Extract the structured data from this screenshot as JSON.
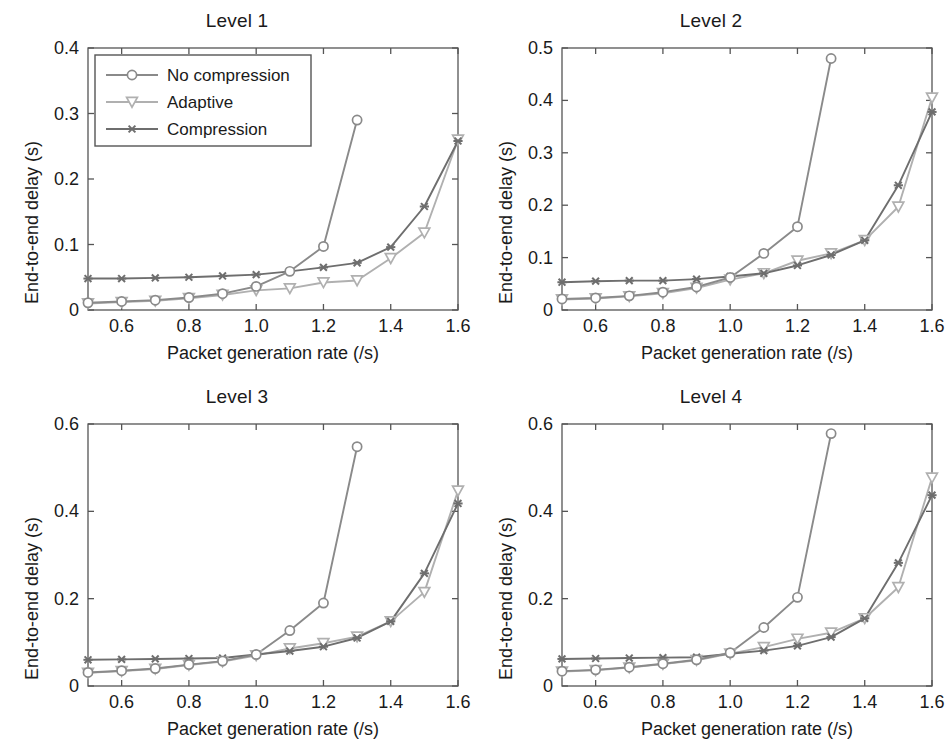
{
  "figure": {
    "width": 948,
    "height": 752,
    "background": "#ffffff",
    "layout": "2x2 grid of line subplots"
  },
  "colors": {
    "no_compression": "#8a8a8a",
    "adaptive": "#b0b0b0",
    "compression": "#6e6e6e",
    "axis": "#555555",
    "text": "#1a1a1a",
    "legend_border": "#555555"
  },
  "legend": {
    "position": "upper-left inside Level 1 axes",
    "entries": [
      {
        "label": "No compression",
        "marker": "circle-marker",
        "color": "#8a8a8a"
      },
      {
        "label": "Adaptive",
        "marker": "triangle-down-marker",
        "color": "#b0b0b0"
      },
      {
        "label": "Compression",
        "marker": "x-marker",
        "color": "#6e6e6e"
      }
    ]
  },
  "common": {
    "xlabel": "Packet generation rate (/s)",
    "ylabel": "End-to-end delay (s)",
    "xticks": [
      "0.6",
      "0.8",
      "1.0",
      "1.2",
      "1.4",
      "1.6"
    ],
    "xtick_values": [
      0.6,
      0.8,
      1.0,
      1.2,
      1.4,
      1.6
    ],
    "xlim": [
      0.5,
      1.6
    ],
    "x": [
      0.5,
      0.6,
      0.7,
      0.8,
      0.9,
      1.0,
      1.1,
      1.2,
      1.3,
      1.4,
      1.5,
      1.6
    ]
  },
  "chart_data": [
    {
      "type": "line",
      "title": "Level 1",
      "xlabel": "Packet generation rate (/s)",
      "ylabel": "End-to-end delay (s)",
      "xlim": [
        0.5,
        1.6
      ],
      "ylim": [
        0,
        0.4
      ],
      "yticks": [
        0,
        0.1,
        0.2,
        0.3,
        0.4
      ],
      "ytick_labels": [
        "0",
        "0.1",
        "0.2",
        "0.3",
        "0.4"
      ],
      "xticks": [
        0.6,
        0.8,
        1.0,
        1.2,
        1.4,
        1.6
      ],
      "xtick_labels": [
        "0.6",
        "0.8",
        "1.0",
        "1.2",
        "1.4",
        "1.6"
      ],
      "grid": false,
      "legend": "upper left",
      "x": [
        0.5,
        0.6,
        0.7,
        0.8,
        0.9,
        1.0,
        1.1,
        1.2,
        1.3,
        1.4,
        1.5,
        1.6
      ],
      "series": [
        {
          "name": "No compression",
          "marker": "circle-marker",
          "color": "#8a8a8a",
          "x": [
            0.5,
            0.6,
            0.7,
            0.8,
            0.9,
            1.0,
            1.1,
            1.2,
            1.3
          ],
          "values": [
            0.011,
            0.013,
            0.015,
            0.019,
            0.025,
            0.036,
            0.059,
            0.097,
            0.29
          ]
        },
        {
          "name": "Adaptive",
          "marker": "triangle-down-marker",
          "color": "#b0b0b0",
          "x": [
            0.5,
            0.6,
            0.7,
            0.8,
            0.9,
            1.0,
            1.1,
            1.2,
            1.3,
            1.4,
            1.5,
            1.6
          ],
          "values": [
            0.01,
            0.012,
            0.014,
            0.018,
            0.023,
            0.03,
            0.033,
            0.042,
            0.045,
            0.079,
            0.118,
            0.26
          ]
        },
        {
          "name": "Compression",
          "marker": "x-marker",
          "color": "#6e6e6e",
          "x": [
            0.5,
            0.6,
            0.7,
            0.8,
            0.9,
            1.0,
            1.1,
            1.2,
            1.3,
            1.4,
            1.5,
            1.6
          ],
          "values": [
            0.048,
            0.048,
            0.049,
            0.05,
            0.052,
            0.054,
            0.059,
            0.065,
            0.072,
            0.096,
            0.158,
            0.258
          ]
        }
      ]
    },
    {
      "type": "line",
      "title": "Level 2",
      "xlabel": "Packet generation rate (/s)",
      "ylabel": "End-to-end delay (s)",
      "xlim": [
        0.5,
        1.6
      ],
      "ylim": [
        0,
        0.5
      ],
      "yticks": [
        0,
        0.1,
        0.2,
        0.3,
        0.4,
        0.5
      ],
      "ytick_labels": [
        "0",
        "0.1",
        "0.2",
        "0.3",
        "0.4",
        "0.5"
      ],
      "xticks": [
        0.6,
        0.8,
        1.0,
        1.2,
        1.4,
        1.6
      ],
      "xtick_labels": [
        "0.6",
        "0.8",
        "1.0",
        "1.2",
        "1.4",
        "1.6"
      ],
      "grid": false,
      "legend": "none",
      "x": [
        0.5,
        0.6,
        0.7,
        0.8,
        0.9,
        1.0,
        1.1,
        1.2,
        1.3,
        1.4,
        1.5,
        1.6
      ],
      "series": [
        {
          "name": "No compression",
          "marker": "circle-marker",
          "color": "#8a8a8a",
          "x": [
            0.5,
            0.6,
            0.7,
            0.8,
            0.9,
            1.0,
            1.1,
            1.2,
            1.3
          ],
          "values": [
            0.021,
            0.023,
            0.027,
            0.034,
            0.044,
            0.062,
            0.108,
            0.159,
            0.48
          ]
        },
        {
          "name": "Adaptive",
          "marker": "triangle-down-marker",
          "color": "#b0b0b0",
          "x": [
            0.5,
            0.6,
            0.7,
            0.8,
            0.9,
            1.0,
            1.1,
            1.2,
            1.3,
            1.4,
            1.5,
            1.6
          ],
          "values": [
            0.02,
            0.022,
            0.026,
            0.032,
            0.042,
            0.058,
            0.07,
            0.094,
            0.108,
            0.133,
            0.197,
            0.405
          ]
        },
        {
          "name": "Compression",
          "marker": "x-marker",
          "color": "#6e6e6e",
          "x": [
            0.5,
            0.6,
            0.7,
            0.8,
            0.9,
            1.0,
            1.1,
            1.2,
            1.3,
            1.4,
            1.5,
            1.6
          ],
          "values": [
            0.053,
            0.055,
            0.056,
            0.056,
            0.059,
            0.064,
            0.07,
            0.085,
            0.105,
            0.133,
            0.238,
            0.378
          ]
        }
      ]
    },
    {
      "type": "line",
      "title": "Level 3",
      "xlabel": "Packet generation rate (/s)",
      "ylabel": "End-to-end delay (s)",
      "xlim": [
        0.5,
        1.6
      ],
      "ylim": [
        0,
        0.6
      ],
      "yticks": [
        0,
        0.2,
        0.4,
        0.6
      ],
      "ytick_labels": [
        "0",
        "0.2",
        "0.4",
        "0.6"
      ],
      "xticks": [
        0.6,
        0.8,
        1.0,
        1.2,
        1.4,
        1.6
      ],
      "xtick_labels": [
        "0.6",
        "0.8",
        "1.0",
        "1.2",
        "1.4",
        "1.6"
      ],
      "grid": false,
      "legend": "none",
      "x": [
        0.5,
        0.6,
        0.7,
        0.8,
        0.9,
        1.0,
        1.1,
        1.2,
        1.3,
        1.4,
        1.5,
        1.6
      ],
      "series": [
        {
          "name": "No compression",
          "marker": "circle-marker",
          "color": "#8a8a8a",
          "x": [
            0.5,
            0.6,
            0.7,
            0.8,
            0.9,
            1.0,
            1.1,
            1.2,
            1.3
          ],
          "values": [
            0.031,
            0.035,
            0.04,
            0.049,
            0.057,
            0.072,
            0.127,
            0.19,
            0.548
          ]
        },
        {
          "name": "Adaptive",
          "marker": "triangle-down-marker",
          "color": "#b0b0b0",
          "x": [
            0.5,
            0.6,
            0.7,
            0.8,
            0.9,
            1.0,
            1.1,
            1.2,
            1.3,
            1.4,
            1.5,
            1.6
          ],
          "values": [
            0.03,
            0.034,
            0.039,
            0.048,
            0.056,
            0.07,
            0.086,
            0.098,
            0.113,
            0.148,
            0.215,
            0.447
          ]
        },
        {
          "name": "Compression",
          "marker": "x-marker",
          "color": "#6e6e6e",
          "x": [
            0.5,
            0.6,
            0.7,
            0.8,
            0.9,
            1.0,
            1.1,
            1.2,
            1.3,
            1.4,
            1.5,
            1.6
          ],
          "values": [
            0.06,
            0.061,
            0.062,
            0.063,
            0.064,
            0.072,
            0.08,
            0.09,
            0.11,
            0.148,
            0.258,
            0.418
          ]
        }
      ]
    },
    {
      "type": "line",
      "title": "Level 4",
      "xlabel": "Packet generation rate (/s)",
      "ylabel": "End-to-end delay (s)",
      "xlim": [
        0.5,
        1.6
      ],
      "ylim": [
        0,
        0.6
      ],
      "yticks": [
        0,
        0.2,
        0.4,
        0.6
      ],
      "ytick_labels": [
        "0",
        "0.2",
        "0.4",
        "0.6"
      ],
      "xticks": [
        0.6,
        0.8,
        1.0,
        1.2,
        1.4,
        1.6
      ],
      "xtick_labels": [
        "0.6",
        "0.8",
        "1.0",
        "1.2",
        "1.4",
        "1.6"
      ],
      "grid": false,
      "legend": "none",
      "x": [
        0.5,
        0.6,
        0.7,
        0.8,
        0.9,
        1.0,
        1.1,
        1.2,
        1.3,
        1.4,
        1.5,
        1.6
      ],
      "series": [
        {
          "name": "No compression",
          "marker": "circle-marker",
          "color": "#8a8a8a",
          "x": [
            0.5,
            0.6,
            0.7,
            0.8,
            0.9,
            1.0,
            1.1,
            1.2,
            1.3
          ],
          "values": [
            0.034,
            0.037,
            0.043,
            0.051,
            0.06,
            0.076,
            0.134,
            0.203,
            0.578
          ]
        },
        {
          "name": "Adaptive",
          "marker": "triangle-down-marker",
          "color": "#b0b0b0",
          "x": [
            0.5,
            0.6,
            0.7,
            0.8,
            0.9,
            1.0,
            1.1,
            1.2,
            1.3,
            1.4,
            1.5,
            1.6
          ],
          "values": [
            0.033,
            0.036,
            0.042,
            0.05,
            0.059,
            0.074,
            0.089,
            0.108,
            0.122,
            0.155,
            0.226,
            0.477
          ]
        },
        {
          "name": "Compression",
          "marker": "x-marker",
          "color": "#6e6e6e",
          "x": [
            0.5,
            0.6,
            0.7,
            0.8,
            0.9,
            1.0,
            1.1,
            1.2,
            1.3,
            1.4,
            1.5,
            1.6
          ],
          "values": [
            0.062,
            0.063,
            0.064,
            0.065,
            0.066,
            0.074,
            0.081,
            0.092,
            0.112,
            0.155,
            0.282,
            0.437
          ]
        }
      ]
    }
  ]
}
